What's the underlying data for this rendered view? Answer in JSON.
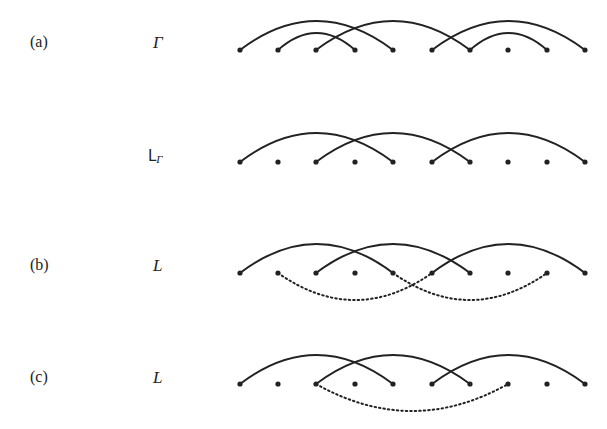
{
  "points_x": [
    240,
    278,
    316,
    355,
    393,
    432,
    470,
    508,
    547,
    585
  ],
  "rows": [
    {
      "id": "a",
      "panel_label": "(a)",
      "symbol": "Γ",
      "symbol_sub": "",
      "label_y": 42,
      "y": 50,
      "solid_arcs": [
        [
          1,
          5,
          30
        ],
        [
          2,
          4,
          18
        ],
        [
          3,
          7,
          30
        ],
        [
          6,
          10,
          30
        ],
        [
          7,
          9,
          18
        ]
      ],
      "dotted_arcs": []
    },
    {
      "id": "lgamma",
      "panel_label": "",
      "symbol": "L",
      "symbol_sub": "Γ",
      "label_y": 155,
      "y": 162,
      "solid_arcs": [
        [
          1,
          5,
          30
        ],
        [
          3,
          7,
          30
        ],
        [
          6,
          10,
          30
        ]
      ],
      "dotted_arcs": []
    },
    {
      "id": "b",
      "panel_label": "(b)",
      "symbol": "L",
      "symbol_sub": "",
      "label_y": 265,
      "y": 273,
      "solid_arcs": [
        [
          1,
          5,
          30
        ],
        [
          3,
          7,
          30
        ],
        [
          6,
          10,
          30
        ]
      ],
      "dotted_arcs": [
        [
          2,
          6,
          28
        ],
        [
          5,
          9,
          28
        ]
      ]
    },
    {
      "id": "c",
      "panel_label": "(c)",
      "symbol": "L",
      "symbol_sub": "",
      "label_y": 377,
      "y": 384,
      "solid_arcs": [
        [
          1,
          5,
          30
        ],
        [
          3,
          7,
          30
        ],
        [
          6,
          10,
          30
        ]
      ],
      "dotted_arcs": [
        [
          3,
          8,
          28
        ]
      ]
    }
  ],
  "labels": {
    "a_panel": "(a)",
    "a_symbol": "Γ",
    "lg_symbol": "L",
    "lg_sub": "Γ",
    "b_panel": "(b)",
    "b_symbol": "L",
    "c_panel": "(c)",
    "c_symbol": "L"
  },
  "colors": {
    "ink": "#222222"
  }
}
